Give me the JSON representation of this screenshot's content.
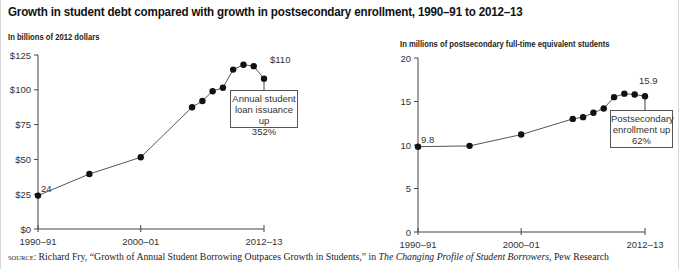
{
  "title": "Growth in student debt compared with growth in postsecondary enrollment, 1990–91 to 2012–13",
  "chart_data": [
    {
      "type": "line",
      "id": "loans",
      "title": "",
      "ylabel": "In billions of 2012 dollars",
      "xlabel": "",
      "x": [
        "1990–91",
        "1995–96",
        "2000–01",
        "2005–06",
        "2006–07",
        "2007–08",
        "2008–09",
        "2009–10",
        "2010–11",
        "2011–12",
        "2012–13"
      ],
      "x_index": [
        0,
        5,
        10,
        15,
        16,
        17,
        18,
        19,
        20,
        21,
        22
      ],
      "values": [
        24,
        39.5,
        51.5,
        87.5,
        92,
        99,
        101.5,
        114.5,
        118,
        117,
        108
      ],
      "ylim": [
        0,
        125
      ],
      "yticks": [
        0,
        25,
        50,
        75,
        100,
        125
      ],
      "ytick_labels": [
        "$0",
        "$25",
        "$50",
        "$75",
        "$100",
        "$125"
      ],
      "xtick_labels": [
        "1990–91",
        "2000–01",
        "2012–13"
      ],
      "xtick_index": [
        0,
        10,
        22
      ],
      "grid": false,
      "point_labels": [
        {
          "index": 0,
          "text": "24"
        },
        {
          "index": 10,
          "text": "$110"
        }
      ],
      "annotation": "Annual student loan issuance up 352%"
    },
    {
      "type": "line",
      "id": "enrollment",
      "title": "",
      "ylabel": "In millions of postsecondary full-time equivalent students",
      "xlabel": "",
      "x": [
        "1990–91",
        "1995–96",
        "2000–01",
        "2005–06",
        "2006–07",
        "2007–08",
        "2008–09",
        "2009–10",
        "2010–11",
        "2011–12",
        "2012–13"
      ],
      "x_index": [
        0,
        5,
        10,
        15,
        16,
        17,
        18,
        19,
        20,
        21,
        22
      ],
      "values": [
        9.8,
        9.9,
        11.2,
        13.0,
        13.2,
        13.7,
        14.2,
        15.5,
        15.9,
        15.8,
        15.6
      ],
      "ylim": [
        0,
        20
      ],
      "yticks": [
        0,
        5,
        10,
        15,
        20
      ],
      "ytick_labels": [
        "0",
        "5",
        "10",
        "15",
        "20"
      ],
      "xtick_labels": [
        "1990–91",
        "2000–01",
        "2012–13"
      ],
      "xtick_index": [
        0,
        10,
        22
      ],
      "grid": false,
      "point_labels": [
        {
          "index": 0,
          "text": "9.8"
        },
        {
          "index": 10,
          "text": "15.9"
        }
      ],
      "annotation": "Postsecondary enrollment up 62%"
    }
  ],
  "left_chart": {
    "unit_label": "In billions of 2012 dollars",
    "note_lines": [
      "Annual student",
      "loan issuance up",
      "352%"
    ]
  },
  "right_chart": {
    "unit_label": "In millions of postsecondary full-time equivalent students",
    "note_lines": [
      "Postsecondary",
      "enrollment up",
      "62%"
    ]
  },
  "source": {
    "label": "source:",
    "text_before": " Richard Fry, “Growth of Annual Student Borrowing Outpaces Growth in Students,” in ",
    "italic": "The Changing Profile of Student Borrowers",
    "text_after": ", Pew Research"
  },
  "colors": {
    "line": "#555555",
    "marker": "#111111",
    "axis": "#444444"
  }
}
